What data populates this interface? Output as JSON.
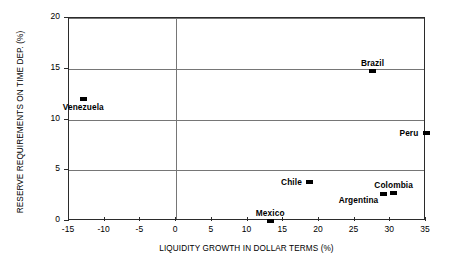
{
  "chart_data": {
    "type": "scatter",
    "title": "",
    "xlabel": "LIQUIDITY GROWTH IN DOLLAR TERMS (%)",
    "ylabel": "RESERVE REQUIREMENTS ON TIME DEP. (%)",
    "xlim": [
      -15,
      35
    ],
    "ylim": [
      0,
      20
    ],
    "xticks": [
      "-15",
      "-10",
      "-5",
      "0",
      "5",
      "10",
      "15",
      "20",
      "25",
      "30",
      "35"
    ],
    "xtick_values": [
      -15,
      -10,
      -5,
      0,
      5,
      10,
      15,
      20,
      25,
      30,
      35
    ],
    "yticks": [
      "0",
      "5",
      "10",
      "15",
      "20"
    ],
    "ytick_values": [
      0,
      5,
      10,
      15,
      20
    ],
    "grid": "horizontal gridlines at y=5,10,15,20 and vertical gridline at x=0",
    "gridlines_h": [
      5,
      10,
      15,
      20
    ],
    "gridlines_v": [
      0
    ],
    "legend": "none",
    "marker": "filled black rectangle",
    "points": [
      {
        "label": "Venezuela",
        "x": -13.0,
        "y": 12.0,
        "label_pos": "below"
      },
      {
        "label": "Brazil",
        "x": 27.5,
        "y": 14.8,
        "label_pos": "above"
      },
      {
        "label": "Peru",
        "x": 35.0,
        "y": 8.7,
        "label_pos": "left"
      },
      {
        "label": "Chile",
        "x": 18.7,
        "y": 3.8,
        "label_pos": "left"
      },
      {
        "label": "Colombia",
        "x": 30.5,
        "y": 2.8,
        "label_pos": "above"
      },
      {
        "label": "Argentina",
        "x": 29.0,
        "y": 2.7,
        "label_pos": "below-left"
      },
      {
        "label": "Mexico",
        "x": 13.2,
        "y": 0.0,
        "label_pos": "above"
      }
    ]
  }
}
